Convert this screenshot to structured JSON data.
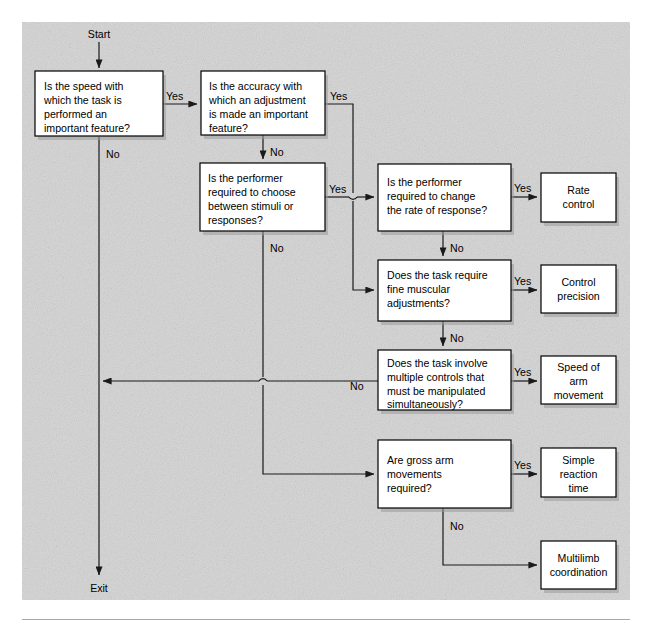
{
  "figure": {
    "kind": "decision-flowchart",
    "background_color": "#d4d4d4",
    "box_fill": "#ffffff",
    "line_color": "#1a1a1a"
  },
  "terminals": {
    "start": "Start",
    "exit": "Exit"
  },
  "decisions": [
    {
      "id": "speed",
      "lines": [
        "Is the speed with",
        "which the task is",
        "performed an",
        "important feature?"
      ]
    },
    {
      "id": "accuracy",
      "lines": [
        "Is the accuracy with",
        "which an adjustment",
        "is made an important",
        "feature?"
      ]
    },
    {
      "id": "choose",
      "lines": [
        "Is the performer",
        "required to choose",
        "between stimuli or",
        "responses?"
      ]
    },
    {
      "id": "rate",
      "lines": [
        "Is the performer",
        "required to change",
        "the rate of response?"
      ]
    },
    {
      "id": "fine",
      "lines": [
        "Does the task require",
        "fine muscular",
        "adjustments?"
      ]
    },
    {
      "id": "multiple",
      "lines": [
        "Does the task involve",
        "multiple controls that",
        "must be manipulated",
        "simultaneously?"
      ]
    },
    {
      "id": "gross",
      "lines": [
        "Are gross arm",
        "movements",
        "required?"
      ]
    }
  ],
  "outcomes": [
    {
      "id": "rate-control",
      "lines": [
        "Rate",
        "control"
      ]
    },
    {
      "id": "control-precision",
      "lines": [
        "Control",
        "precision"
      ]
    },
    {
      "id": "speed-of-arm-movement",
      "lines": [
        "Speed of",
        "arm",
        "movement"
      ]
    },
    {
      "id": "simple-reaction-time",
      "lines": [
        "Simple",
        "reaction",
        "time"
      ]
    },
    {
      "id": "multilimb-coordination",
      "lines": [
        "Multilimb",
        "coordination"
      ]
    }
  ],
  "edge_labels": {
    "yes": "Yes",
    "no": "No"
  },
  "edges": [
    {
      "from": "speed",
      "to": "accuracy",
      "label": "Yes"
    },
    {
      "from": "speed",
      "to": "exit",
      "label": "No"
    },
    {
      "from": "accuracy",
      "to": "rate",
      "label": "Yes"
    },
    {
      "from": "accuracy",
      "to": "choose",
      "label": "No"
    },
    {
      "from": "choose",
      "to": "rate",
      "label": "Yes"
    },
    {
      "from": "choose",
      "to": "gross",
      "label": "No"
    },
    {
      "from": "rate",
      "to": "rate-control",
      "label": "Yes"
    },
    {
      "from": "rate",
      "to": "fine",
      "label": "No"
    },
    {
      "from": "fine",
      "to": "control-precision",
      "label": "Yes"
    },
    {
      "from": "fine",
      "to": "multiple",
      "label": "No"
    },
    {
      "from": "multiple",
      "to": "speed-of-arm-movement",
      "label": "Yes"
    },
    {
      "from": "multiple",
      "to": "exit",
      "label": "No"
    },
    {
      "from": "gross",
      "to": "simple-reaction-time",
      "label": "Yes"
    },
    {
      "from": "gross",
      "to": "multilimb-coordination",
      "label": "No"
    }
  ]
}
